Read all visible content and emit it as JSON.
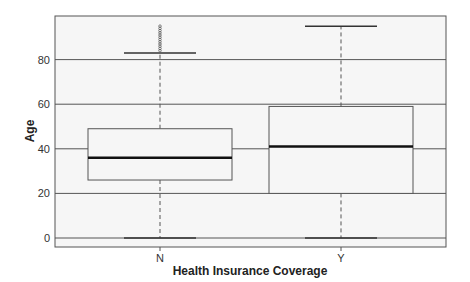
{
  "chart_data": {
    "type": "boxplot",
    "title": "",
    "xlabel": "Health Insurance Coverage",
    "ylabel": "Age",
    "categories": [
      "N",
      "Y"
    ],
    "yticks": [
      0,
      20,
      40,
      60,
      80
    ],
    "ylim": [
      -4,
      99
    ],
    "grid": true,
    "boxes": [
      {
        "category": "N",
        "whisker_low": 0,
        "q1": 26,
        "median": 36,
        "q3": 49,
        "whisker_high": 83,
        "outliers": [
          84,
          85,
          86,
          87,
          88,
          89,
          90,
          91,
          92,
          93,
          94,
          95
        ]
      },
      {
        "category": "Y",
        "whisker_low": 0,
        "q1": 20,
        "median": 41,
        "q3": 59,
        "whisker_high": 95,
        "outliers": []
      }
    ]
  }
}
